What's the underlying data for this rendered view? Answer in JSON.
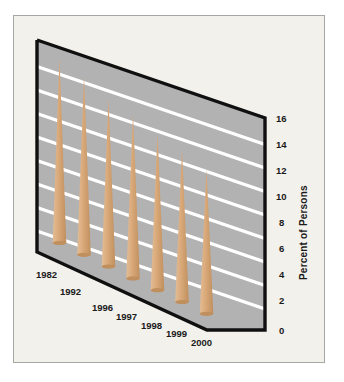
{
  "chart_data": {
    "type": "bar",
    "title": "",
    "subtitle": "",
    "xlabel": "",
    "ylabel": "Percent of Persons",
    "categories": [
      "1982",
      "1992",
      "1996",
      "1997",
      "1998",
      "1999",
      "2000"
    ],
    "values": [
      15.0,
      14.5,
      13.6,
      13.3,
      12.7,
      12.4,
      11.7
    ],
    "series": [
      {
        "name": "Percent of Persons",
        "values": [
          15.0,
          14.5,
          13.6,
          13.3,
          12.7,
          12.4,
          11.7
        ]
      }
    ],
    "ylim": [
      0,
      16
    ],
    "ytick_labels": [
      "0",
      "2",
      "4",
      "6",
      "8",
      "10",
      "12",
      "14",
      "16"
    ],
    "ytick_values": [
      0,
      2,
      4,
      6,
      8,
      10,
      12,
      14,
      16
    ],
    "grid": true,
    "gridline_values": [
      2,
      4,
      6,
      8,
      10,
      12,
      14,
      16
    ],
    "legend": "none",
    "legend_position": "none",
    "annotations": [],
    "style": {
      "projection": "3d-perspective",
      "bar_shape": "cone",
      "bar_color": "#d9a878",
      "bar_shade_color": "#c08f5e",
      "plot_background": "#b2b2b2",
      "gridline_color": "#ffffff",
      "axis_line_color": "#101010",
      "card_background": "#f3f1ec",
      "frame_color": "#a6a6a2",
      "text_color": "#1a1a1a"
    }
  }
}
